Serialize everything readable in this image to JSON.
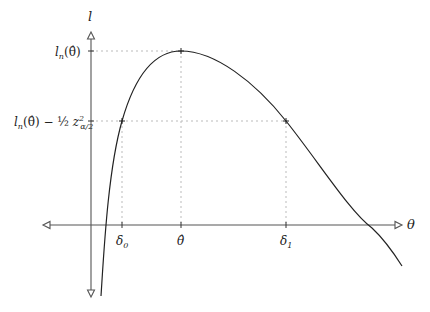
{
  "diagram": {
    "y_axis_label": "l",
    "x_axis_label": "θ",
    "y_ticks": [
      {
        "label_main": "l",
        "label_sub": "n",
        "label_rest": "(θ̂)",
        "full": "l_n(θ̂)"
      },
      {
        "label_main": "l",
        "label_sub": "n",
        "label_rest": "(θ̂) − ½ z²",
        "full": "l_n(θ̂) − ½ z²_{α/2}",
        "z_sub": "α/2",
        "z_sup": "2",
        "half": "½"
      }
    ],
    "x_ticks": [
      {
        "label": "δ",
        "sub": "0",
        "full": "δ_0"
      },
      {
        "label": "θ̂",
        "full": "θ̂"
      },
      {
        "label": "δ",
        "sub": "1",
        "full": "δ_1"
      }
    ],
    "points": [
      {
        "name": "delta0",
        "x": 122,
        "y": 121
      },
      {
        "name": "theta-hat-peak",
        "x": 181,
        "y": 51
      },
      {
        "name": "delta1",
        "x": 286,
        "y": 121
      }
    ],
    "colors": {
      "axis": "#555555",
      "curve": "#222222",
      "guide": "#bbbbbb"
    }
  }
}
